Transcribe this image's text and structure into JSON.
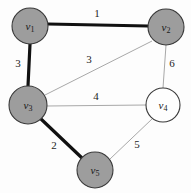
{
  "figure": {
    "kind": "weighted-undirected-graph",
    "width": 191,
    "height": 193,
    "background_color": "#fdfdfd"
  },
  "style": {
    "node_fill_shaded": "#9d9d9d",
    "node_fill_open": "#fefefe",
    "node_stroke": "#3a3a3a",
    "edge_thin_color": "#a8a8a8",
    "edge_bold_color": "#111111",
    "label_color": "#1a1a1a"
  },
  "nodes": [
    {
      "id": "v1",
      "name": "v",
      "subscript": "1",
      "cx": 30,
      "cy": 26,
      "r": 18,
      "shaded": true
    },
    {
      "id": "v2",
      "name": "v",
      "subscript": "2",
      "cx": 166,
      "cy": 27,
      "r": 18,
      "shaded": true
    },
    {
      "id": "v3",
      "name": "v",
      "subscript": "3",
      "cx": 28,
      "cy": 105,
      "r": 19,
      "shaded": true
    },
    {
      "id": "v4",
      "name": "v",
      "subscript": "4",
      "cx": 163,
      "cy": 105,
      "r": 17,
      "shaded": false
    },
    {
      "id": "v5",
      "name": "v",
      "subscript": "5",
      "cx": 95,
      "cy": 170,
      "r": 18,
      "shaded": true
    }
  ],
  "edges": [
    {
      "id": "e-v1-v2",
      "from": "v1",
      "to": "v2",
      "weight": "1",
      "bold": true,
      "x1": 48,
      "y1": 24,
      "x2": 148,
      "y2": 26,
      "label_x": 97,
      "label_y": 14
    },
    {
      "id": "e-v1-v3",
      "from": "v1",
      "to": "v3",
      "weight": "3",
      "bold": true,
      "x1": 30,
      "y1": 44,
      "x2": 28,
      "y2": 86,
      "label_x": 18,
      "label_y": 64
    },
    {
      "id": "e-v2-v3",
      "from": "v2",
      "to": "v3",
      "weight": "3",
      "bold": false,
      "x1": 152,
      "y1": 41,
      "x2": 45,
      "y2": 95,
      "label_x": 89,
      "label_y": 60
    },
    {
      "id": "e-v2-v4",
      "from": "v2",
      "to": "v4",
      "weight": "6",
      "bold": false,
      "x1": 166,
      "y1": 45,
      "x2": 163,
      "y2": 88,
      "label_x": 172,
      "label_y": 64
    },
    {
      "id": "e-v3-v4",
      "from": "v3",
      "to": "v4",
      "weight": "4",
      "bold": false,
      "x1": 47,
      "y1": 106,
      "x2": 146,
      "y2": 105,
      "label_x": 96,
      "label_y": 97
    },
    {
      "id": "e-v3-v5",
      "from": "v3",
      "to": "v5",
      "weight": "2",
      "bold": true,
      "x1": 41,
      "y1": 119,
      "x2": 82,
      "y2": 158,
      "label_x": 54,
      "label_y": 146
    },
    {
      "id": "e-v4-v5",
      "from": "v4",
      "to": "v5",
      "weight": "5",
      "bold": false,
      "x1": 152,
      "y1": 119,
      "x2": 110,
      "y2": 159,
      "label_x": 137,
      "label_y": 145
    }
  ]
}
